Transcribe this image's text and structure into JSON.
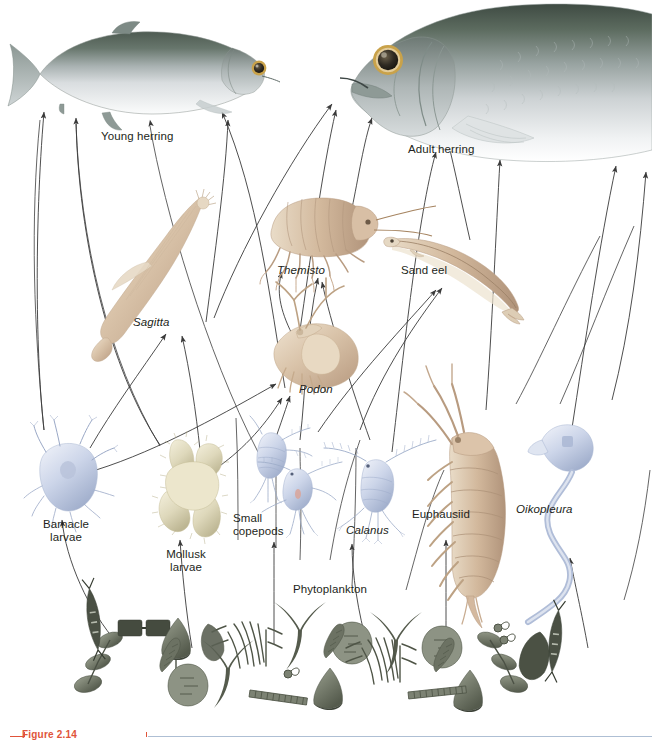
{
  "figure": {
    "caption_number": "Figure 2.14",
    "background": "#ffffff",
    "text_color": "#231f20",
    "caption_color": "#e0543a",
    "rule_color": "#aebfd4",
    "arrow_color": "#3a3a3a"
  },
  "labels": {
    "young_herring": "Young herring",
    "adult_herring": "Adult herring",
    "sagitta": "Sagitta",
    "themisto": "Themisto",
    "sand_eel": "Sand eel",
    "podon": "Podon",
    "barnacle_larvae_l1": "Barnacle",
    "barnacle_larvae_l2": "larvae",
    "mollusk_larvae_l1": "Mollusk",
    "mollusk_larvae_l2": "larvae",
    "small_copepods_l1": "Small",
    "small_copepods_l2": "copepods",
    "calanus": "Calanus",
    "phytoplankton": "Phytoplankton",
    "euphausiid": "Euphausiid",
    "oikopleura": "Oikopleura"
  },
  "organisms": [
    {
      "id": "young-herring",
      "label": "Young herring",
      "italic": false,
      "kind": "fish",
      "x": 130,
      "y": 70,
      "colors": {
        "dorsal": "#5d6b63",
        "flank": "#b9c0c2",
        "belly": "#f2f4f5",
        "eye_ring": "#c9a24a",
        "pupil": "#2f2a22"
      }
    },
    {
      "id": "adult-herring",
      "label": "Adult herring",
      "italic": false,
      "kind": "fish",
      "x": 500,
      "y": 85,
      "colors": {
        "dorsal": "#4f5a52",
        "flank": "#b5bcbd",
        "belly": "#f4f5f6",
        "eye_ring": "#c9a24a",
        "pupil": "#2f2a22"
      }
    },
    {
      "id": "sagitta",
      "label": "Sagitta",
      "italic": true,
      "kind": "arrow-worm",
      "x": 150,
      "y": 270,
      "color": "#ddccb6"
    },
    {
      "id": "themisto",
      "label": "Themisto",
      "italic": true,
      "kind": "amphipod",
      "x": 315,
      "y": 230,
      "color": "#c9aa92"
    },
    {
      "id": "sand-eel",
      "label": "Sand eel",
      "italic": false,
      "kind": "eel",
      "x": 455,
      "y": 265,
      "color": "#ddcdb5"
    },
    {
      "id": "podon",
      "label": "Podon",
      "italic": true,
      "kind": "cladoceran",
      "x": 310,
      "y": 360,
      "color": "#d8bfa8"
    },
    {
      "id": "barnacle-larvae",
      "label": "Barnacle larvae",
      "italic": false,
      "kind": "nauplius",
      "x": 68,
      "y": 475,
      "color": "#c9d2e6"
    },
    {
      "id": "mollusk-larvae",
      "label": "Mollusk larvae",
      "italic": false,
      "kind": "veliger",
      "x": 182,
      "y": 490,
      "color": "#ded9c0"
    },
    {
      "id": "small-copepods",
      "label": "Small copepods",
      "italic": false,
      "kind": "copepod",
      "x": 272,
      "y": 480,
      "color": "#b9c6df"
    },
    {
      "id": "calanus",
      "label": "Calanus",
      "italic": true,
      "kind": "copepod",
      "x": 378,
      "y": 490,
      "color": "#b9c6df"
    },
    {
      "id": "euphausiid",
      "label": "Euphausiid",
      "italic": false,
      "kind": "krill",
      "x": 470,
      "y": 495,
      "color": "#c9ab92"
    },
    {
      "id": "oikopleura",
      "label": "Oikopleura",
      "italic": true,
      "kind": "larvacean",
      "x": 566,
      "y": 490,
      "color": "#c3cadf"
    },
    {
      "id": "phytoplankton",
      "label": "Phytoplankton",
      "italic": false,
      "kind": "phytoplankton-band",
      "x": 330,
      "y": 660,
      "color": "#6d7468"
    }
  ],
  "food_web_edges": [
    {
      "from": "barnacle-larvae",
      "to": "young-herring"
    },
    {
      "from": "mollusk-larvae",
      "to": "young-herring"
    },
    {
      "from": "small-copepods",
      "to": "young-herring"
    },
    {
      "from": "sagitta",
      "to": "young-herring"
    },
    {
      "from": "podon",
      "to": "young-herring"
    },
    {
      "from": "calanus",
      "to": "adult-herring"
    },
    {
      "from": "euphausiid",
      "to": "adult-herring"
    },
    {
      "from": "oikopleura",
      "to": "adult-herring"
    },
    {
      "from": "themisto",
      "to": "adult-herring"
    },
    {
      "from": "sand-eel",
      "to": "adult-herring"
    },
    {
      "from": "sagitta",
      "to": "adult-herring"
    },
    {
      "from": "podon",
      "to": "themisto"
    },
    {
      "from": "small-copepods",
      "to": "themisto"
    },
    {
      "from": "calanus",
      "to": "sand-eel"
    },
    {
      "from": "small-copepods",
      "to": "sand-eel"
    },
    {
      "from": "barnacle-larvae",
      "to": "sagitta"
    },
    {
      "from": "mollusk-larvae",
      "to": "sagitta"
    },
    {
      "from": "small-copepods",
      "to": "podon"
    },
    {
      "from": "mollusk-larvae",
      "to": "podon"
    },
    {
      "from": "barnacle-larvae",
      "to": "podon"
    },
    {
      "from": "phytoplankton",
      "to": "barnacle-larvae"
    },
    {
      "from": "phytoplankton",
      "to": "mollusk-larvae"
    },
    {
      "from": "phytoplankton",
      "to": "small-copepods"
    },
    {
      "from": "phytoplankton",
      "to": "calanus"
    },
    {
      "from": "phytoplankton",
      "to": "euphausiid"
    },
    {
      "from": "phytoplankton",
      "to": "oikopleura"
    }
  ]
}
